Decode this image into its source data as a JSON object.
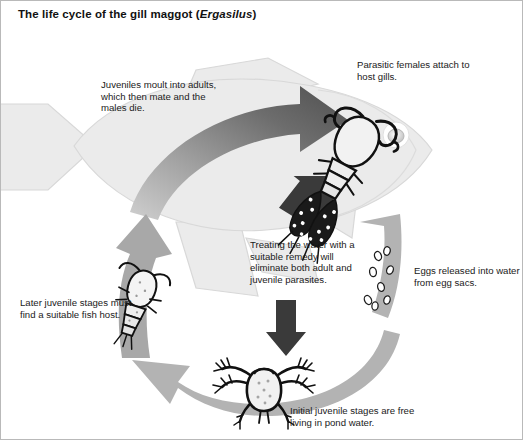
{
  "title": {
    "prefix": "The life cycle of the gill maggot (",
    "species": "Ergasilus",
    "suffix": ")"
  },
  "labels": {
    "moult": "Juveniles moult into adults, which then mate and the males die.",
    "attach": "Parasitic females attach to host gills.",
    "treating": "Treating the water with a suitable remedy will eliminate both adult and juvenile parasites.",
    "eggs": "Eggs released into water from egg sacs.",
    "later": "Later juvenile stages must find a suitable fish host.",
    "initial": "Initial juvenile stages are free living in pond water."
  },
  "colors": {
    "fish_fill": "#ebebeb",
    "fish_outline": "#d2d2d2",
    "arrow_gray": "#b3b3b3",
    "arrow_dark_gradient_start": "#5e5e5e",
    "arrow_dark_gradient_end": "#c9c9c9",
    "treatment_arrow": "#3a3a3a",
    "parasite_outline": "#111111",
    "parasite_body": "#f2f2f2",
    "text": "#1a1a1a",
    "background": "#ffffff"
  },
  "illustrations": {
    "fish": "host-fish",
    "adult_parasite": "adult-female-ergasilus-on-gill",
    "eggs": "released-eggs",
    "nauplius": "free-living-nauplius-larva",
    "copepodid": "copepodid-juvenile-stage"
  },
  "cycle": {
    "stages": [
      {
        "name": "attachment",
        "label_key": "attach"
      },
      {
        "name": "maturation",
        "label_key": "moult"
      },
      {
        "name": "egg-release",
        "label_key": "eggs"
      },
      {
        "name": "free-living-juvenile",
        "label_key": "initial"
      },
      {
        "name": "host-finding",
        "label_key": "later"
      }
    ],
    "intervention": {
      "name": "chemical-treatment",
      "label_key": "treating"
    }
  }
}
